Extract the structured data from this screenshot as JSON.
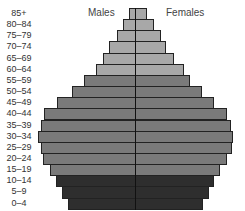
{
  "chart_data": {
    "type": "bar",
    "orientation": "horizontal",
    "subtype": "population_pyramid",
    "title": "",
    "xlabel": "",
    "ylabel": "",
    "grid": false,
    "legend_position": "top, inside plot",
    "categories": [
      "85+",
      "80-84",
      "75-79",
      "70-74",
      "65-69",
      "60-64",
      "55-59",
      "50-54",
      "45-49",
      "40-44",
      "35-39",
      "30-34",
      "25-29",
      "20-24",
      "15-19",
      "10-14",
      "5-9",
      "0-4"
    ],
    "category_labels": [
      "85+",
      "80–84",
      "75–79",
      "70–74",
      "65–69",
      "60–64",
      "55–59",
      "50–54",
      "45–49",
      "40–44",
      "35–39",
      "30–34",
      "25–29",
      "20–24",
      "15–19",
      "10–14",
      "5–9",
      "0–4"
    ],
    "series": [
      {
        "name": "Males",
        "values": [
          6,
          12,
          18,
          26,
          32,
          39,
          51,
          63,
          78,
          91,
          94,
          97,
          94,
          92,
          85,
          79,
          73,
          67
        ]
      },
      {
        "name": "Females",
        "values": [
          11,
          18,
          25,
          30,
          38,
          48,
          54,
          66,
          78,
          91,
          95,
          97,
          96,
          91,
          84,
          78,
          73,
          67
        ]
      }
    ],
    "units": "relative bar length (px from center)",
    "band_colors": {
      "65_plus": "#a8a8a8",
      "15_to_64": "#7a7a7a",
      "0_to_14": "#2e2e2e"
    }
  },
  "legend": {
    "males_label": "Males",
    "females_label": "Females"
  }
}
